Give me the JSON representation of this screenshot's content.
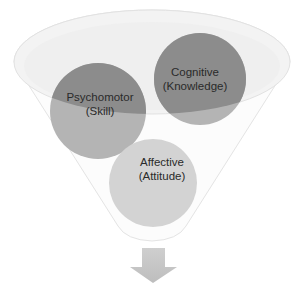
{
  "diagram": {
    "type": "funnel",
    "funnel": {
      "fill": "#fbfbfb",
      "rim_fill": "#f1f1f1",
      "stroke": "#e2e2e2"
    },
    "circles": [
      {
        "id": "psychomotor",
        "line1": "Psychomotor",
        "line2": "(Skill)",
        "fill_top": "#8c8c8c",
        "fill_bottom": "#b4b4b4"
      },
      {
        "id": "cognitive",
        "line1": "Cognitive",
        "line2": "(Knowledge)",
        "fill_top": "#8c8c8c",
        "fill_bottom": "#b4b4b4"
      },
      {
        "id": "affective",
        "line1": "Affective",
        "line2": "(Attitude)",
        "fill_top": "#d3d3d3",
        "fill_bottom": "#d3d3d3"
      }
    ],
    "arrow": {
      "direction": "down",
      "fill": "#c4c4c4"
    }
  }
}
